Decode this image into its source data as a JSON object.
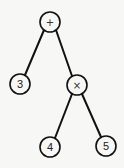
{
  "diagram": {
    "type": "expression-tree",
    "nodes": [
      {
        "id": "n0",
        "label": "+",
        "kind": "operator",
        "cx": 50,
        "cy": 22
      },
      {
        "id": "n1",
        "label": "3",
        "kind": "operand",
        "cx": 20,
        "cy": 84
      },
      {
        "id": "n2",
        "label": "×",
        "kind": "operator",
        "cx": 77,
        "cy": 85
      },
      {
        "id": "n3",
        "label": "4",
        "kind": "operand",
        "cx": 50,
        "cy": 147
      },
      {
        "id": "n4",
        "label": "5",
        "kind": "operand",
        "cx": 106,
        "cy": 146
      }
    ],
    "edges": [
      {
        "from": "n0",
        "to": "n1"
      },
      {
        "from": "n0",
        "to": "n2"
      },
      {
        "from": "n2",
        "to": "n3"
      },
      {
        "from": "n2",
        "to": "n4"
      }
    ],
    "stroke_color": "#111111",
    "fill_color": "#f7f7f5"
  }
}
